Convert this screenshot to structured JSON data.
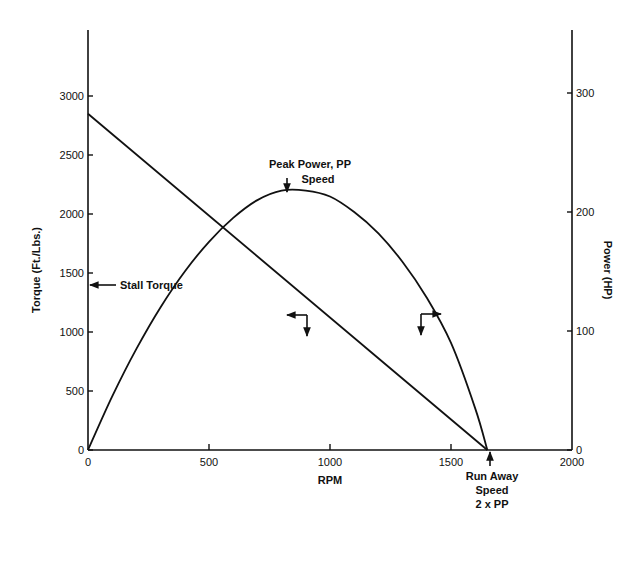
{
  "chart_data": {
    "type": "line",
    "title": "",
    "xlabel": "RPM",
    "ylabel": "Torque (Ft./Lbs.)",
    "y2label": "Power (HP)",
    "xlim": [
      0,
      2000
    ],
    "ylim": [
      0,
      3000
    ],
    "y2lim": [
      0,
      300
    ],
    "grid": false,
    "legend": null,
    "x_ticks": [
      0,
      500,
      1000,
      1500,
      2000
    ],
    "y_ticks": [
      0,
      500,
      1000,
      1500,
      2000,
      2500,
      3000
    ],
    "y2_ticks": [
      0,
      100,
      200,
      300
    ],
    "series": [
      {
        "name": "Torque",
        "axis": "left",
        "x": [
          0,
          1650
        ],
        "values": [
          2850,
          0
        ]
      },
      {
        "name": "Power",
        "axis": "right",
        "x": [
          0,
          100,
          200,
          300,
          400,
          500,
          600,
          700,
          800,
          900,
          1000,
          1100,
          1200,
          1300,
          1400,
          1500,
          1600,
          1650
        ],
        "values": [
          0,
          45,
          85,
          120,
          150,
          175,
          195,
          210,
          218,
          218,
          213,
          200,
          182,
          158,
          128,
          90,
          35,
          0
        ]
      }
    ],
    "annotations": [
      {
        "text": "Stall Torque",
        "x": 0,
        "y": 2850,
        "axis": "left"
      },
      {
        "text": "Peak Power, PP Speed",
        "x": 820,
        "y": 220,
        "axis": "right"
      },
      {
        "text": "Run Away Speed 2 x PP",
        "x": 1650,
        "y": 0
      }
    ]
  },
  "labels": {
    "xlabel": "RPM",
    "ylabel": "Torque (Ft./Lbs.)",
    "y2label": "Power (HP)",
    "stall": "Stall Torque",
    "peak1": "Peak Power, PP",
    "peak2": "Speed",
    "run1": "Run Away",
    "run2": "Speed",
    "run3": "2 x PP"
  }
}
